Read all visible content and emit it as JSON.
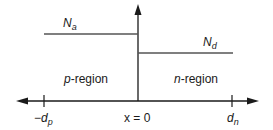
{
  "diagram": {
    "title": "",
    "acceptor_label": {
      "main": "N",
      "sub": "a"
    },
    "donor_label": {
      "main": "N",
      "sub": "d"
    },
    "regions": [
      {
        "italic": "p",
        "rest": "-region"
      },
      {
        "italic": "n",
        "rest": "-region"
      }
    ],
    "axis_ticks": [
      {
        "prefix": "−",
        "main": "d",
        "sub": "p"
      },
      {
        "text": "x = 0"
      },
      {
        "prefix": "",
        "main": "d",
        "sub": "n"
      }
    ],
    "colors": {
      "line": "#1a1a1a",
      "level": "#555555"
    }
  }
}
